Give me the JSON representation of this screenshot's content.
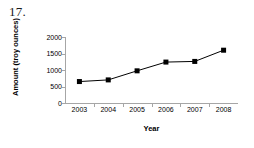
{
  "question": {
    "number": "17."
  },
  "chart_data": {
    "type": "line",
    "title": "",
    "xlabel": "Year",
    "ylabel": "Amount (troy ounces)",
    "categories": [
      "2003",
      "2004",
      "2005",
      "2006",
      "2007",
      "2008"
    ],
    "x": [
      2003,
      2004,
      2005,
      2006,
      2007,
      2008
    ],
    "values": [
      650,
      700,
      975,
      1240,
      1260,
      1600
    ],
    "series": [
      {
        "name": "Amount",
        "values": [
          650,
          700,
          975,
          1240,
          1260,
          1600
        ],
        "marker": "square",
        "marker_color": "#000000",
        "line_color": "#000000"
      }
    ],
    "ylim": [
      0,
      2000
    ],
    "yticks": [
      0,
      500,
      1000,
      1500,
      2000
    ],
    "ytick_labels": [
      "0",
      "500",
      "1000",
      "1500",
      "2000"
    ],
    "grid": false,
    "legend": false,
    "legend_position": "none"
  }
}
